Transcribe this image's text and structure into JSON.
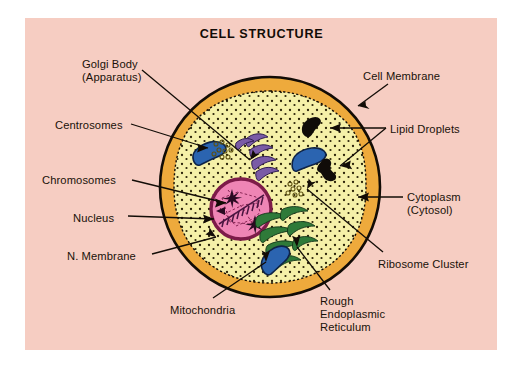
{
  "figure": {
    "title": "CELL STRUCTURE",
    "background_color": "#f6cdc2",
    "page_color": "#ffffff"
  },
  "palette": {
    "background_pink": "#f6cdc2",
    "membrane_orange": "#eeaa3c",
    "cytoplasm_yellow": "#f5f0a8",
    "nucleus_pink": "#ef85b5",
    "nucleus_border": "#7d1b49",
    "mitochondria_blue": "#2b64b0",
    "mitochondria_dark": "#122a52",
    "golgi_purple": "#7a5ba6",
    "er_green": "#2f7a39",
    "lipid_black": "#100c08",
    "outline_black": "#120c06",
    "text_black": "#1a1209"
  },
  "labels": [
    {
      "id": "golgi-body",
      "text": "Golgi Body\n(Apparatus)",
      "x": 82,
      "y": 58,
      "align": "left"
    },
    {
      "id": "centrosomes",
      "text": "Centrosomes",
      "x": 55,
      "y": 119,
      "align": "left"
    },
    {
      "id": "chromosomes",
      "text": "Chromosomes",
      "x": 42,
      "y": 174,
      "align": "left"
    },
    {
      "id": "nucleus",
      "text": "Nucleus",
      "x": 73,
      "y": 212,
      "align": "left"
    },
    {
      "id": "n-membrane",
      "text": "N. Membrane",
      "x": 67,
      "y": 250,
      "align": "left"
    },
    {
      "id": "cell-membrane",
      "text": "Cell Membrane",
      "x": 363,
      "y": 70,
      "align": "left"
    },
    {
      "id": "lipid-droplets",
      "text": "Lipid Droplets",
      "x": 390,
      "y": 123,
      "align": "left"
    },
    {
      "id": "cytoplasm",
      "text": "Cytoplasm\n(Cytosol)",
      "x": 407,
      "y": 191,
      "align": "left"
    },
    {
      "id": "ribosome-cluster",
      "text": "Ribosome Cluster",
      "x": 378,
      "y": 258,
      "align": "left"
    },
    {
      "id": "mitochondria",
      "text": "Mitochondria",
      "x": 170,
      "y": 304,
      "align": "left"
    },
    {
      "id": "rough-er",
      "text": "Rough\nEndoplasmic\nReticulum",
      "x": 320,
      "y": 295,
      "align": "left"
    }
  ],
  "organelles": [
    {
      "id": "cell-membrane",
      "name": "Cell Membrane",
      "color": "#eeaa3c"
    },
    {
      "id": "cytoplasm",
      "name": "Cytoplasm (Cytosol)",
      "color": "#f5f0a8"
    },
    {
      "id": "nucleus",
      "name": "Nucleus",
      "color": "#ef85b5"
    },
    {
      "id": "nuclear-membrane",
      "name": "N. Membrane",
      "color": "#7d1b49"
    },
    {
      "id": "chromosomes",
      "name": "Chromosomes",
      "color": "#7d1b49"
    },
    {
      "id": "centrosomes",
      "name": "Centrosomes",
      "color": "#7a5ba6"
    },
    {
      "id": "golgi-body",
      "name": "Golgi Body (Apparatus)",
      "color": "#7a5ba6"
    },
    {
      "id": "mitochondria",
      "name": "Mitochondria",
      "color": "#2b64b0",
      "count": 4
    },
    {
      "id": "rough-er",
      "name": "Rough Endoplasmic Reticulum",
      "color": "#2f7a39"
    },
    {
      "id": "lipid-droplets",
      "name": "Lipid Droplets",
      "color": "#100c08",
      "count": 2
    },
    {
      "id": "ribosome-cluster",
      "name": "Ribosome Cluster",
      "color": "#8a7a20",
      "count": 3
    }
  ]
}
